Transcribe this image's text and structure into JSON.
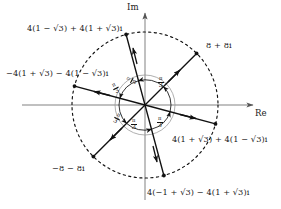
{
  "diagram": {
    "type": "argand-diagram",
    "title_visible": false,
    "axes": {
      "real_label": "Re",
      "imag_label": "Im"
    },
    "center": {
      "x": 145,
      "y": 105
    },
    "outer_circle": {
      "radius": 73,
      "style": "dashed",
      "color": "#111111"
    },
    "inner_circle": {
      "radius": 30,
      "style": "solid",
      "color": "#8a8a8a"
    },
    "angle_label": "π/3",
    "angle_numerator": "π",
    "angle_denominator": "3",
    "angle_count": 6,
    "roots": [
      {
        "id": "root-45",
        "angle_deg": 45,
        "label": "8 + 8i",
        "label_x": 206,
        "label_y": 40
      },
      {
        "id": "root-105",
        "angle_deg": 105,
        "label": "4(1 − √3) + 4(1 + √3)i",
        "label_x": 27,
        "label_y": 23
      },
      {
        "id": "root-165",
        "angle_deg": 165,
        "label": "−4(1 + √3) − 4(1 − √3)i",
        "label_x": 6,
        "label_y": 68
      },
      {
        "id": "root-225",
        "angle_deg": 225,
        "label": "−8 − 8i",
        "label_x": 52,
        "label_y": 163
      },
      {
        "id": "root-285",
        "angle_deg": 285,
        "label": "4(−1 + √3) − 4(1 + √3)i",
        "label_x": 147,
        "label_y": 187
      },
      {
        "id": "root-345",
        "angle_deg": 345,
        "label": "4(1 + √3) + 4(1 − √3)i",
        "label_x": 172,
        "label_y": 134
      }
    ]
  }
}
